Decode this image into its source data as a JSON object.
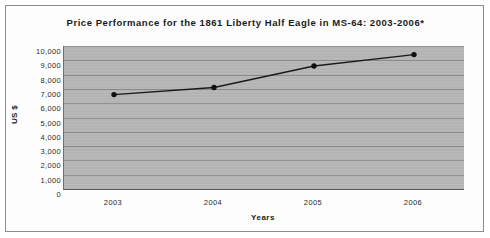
{
  "chart_data": {
    "type": "line",
    "title": "Price Performance for the 1861 Liberty Half Eagle in MS-64: 2003-2006*",
    "xlabel": "Years",
    "ylabel": "US $",
    "categories": [
      "2003",
      "2004",
      "2005",
      "2006"
    ],
    "values": [
      6600,
      7100,
      8600,
      9400
    ],
    "series": [
      {
        "name": "Price",
        "values": [
          6600,
          7100,
          8600,
          9400
        ]
      }
    ],
    "ylim": [
      0,
      10000
    ],
    "ytick_labels": [
      "10,000",
      "9,000",
      "8,000",
      "7,000",
      "6,000",
      "5,000",
      "4,000",
      "3,000",
      "2,000",
      "1,000",
      "0"
    ],
    "ytick_values": [
      10000,
      9000,
      8000,
      7000,
      6000,
      5000,
      4000,
      3000,
      2000,
      1000,
      0
    ],
    "ytick_step": 1000,
    "grid": "horizontal",
    "legend": "none",
    "marker": "filled-circle",
    "plot_background_color": "#b4b4b4",
    "line_color": "#1a1a1a",
    "marker_color": "#101010",
    "gridline_color": "#8a8a8a",
    "frame_color": "#8d8d8d"
  }
}
